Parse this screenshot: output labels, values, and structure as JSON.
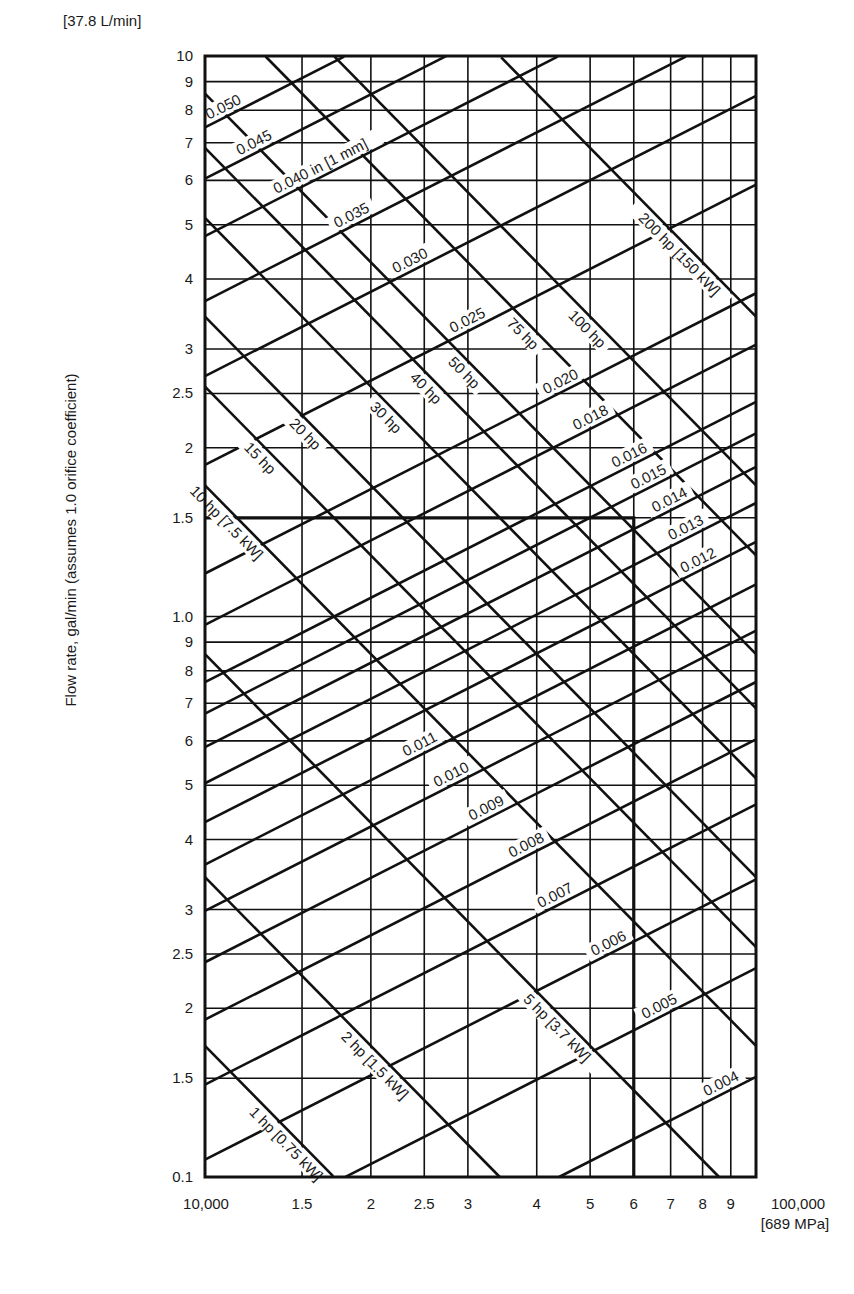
{
  "chart_data": {
    "type": "line",
    "title": "",
    "xlabel": "Pressure, psi",
    "ylabel": "Flow rate, gal/min  (assumes 1.0 orifice coefficient)",
    "x_scale": "log",
    "y_scale": "log",
    "xlim": [
      10000,
      100000
    ],
    "ylim": [
      0.1,
      10
    ],
    "grid": true,
    "x_unit_note": "[689 MPa]",
    "y_unit_note": "[37.8 L/min]",
    "x_ticks": [
      {
        "value": 10000,
        "label": "10,000"
      },
      {
        "value": 15000,
        "label": "1.5"
      },
      {
        "value": 20000,
        "label": "2"
      },
      {
        "value": 25000,
        "label": "2.5"
      },
      {
        "value": 30000,
        "label": "3"
      },
      {
        "value": 40000,
        "label": "4"
      },
      {
        "value": 50000,
        "label": "5"
      },
      {
        "value": 60000,
        "label": "6"
      },
      {
        "value": 70000,
        "label": "7"
      },
      {
        "value": 80000,
        "label": "8"
      },
      {
        "value": 90000,
        "label": "9"
      },
      {
        "value": 100000,
        "label": "100,000"
      }
    ],
    "y_ticks": [
      {
        "value": 10,
        "label": "10"
      },
      {
        "value": 9,
        "label": "9"
      },
      {
        "value": 8,
        "label": "8"
      },
      {
        "value": 7,
        "label": "7"
      },
      {
        "value": 6,
        "label": "6"
      },
      {
        "value": 5,
        "label": "5"
      },
      {
        "value": 4,
        "label": "4"
      },
      {
        "value": 3,
        "label": "3"
      },
      {
        "value": 2.5,
        "label": "2.5"
      },
      {
        "value": 2,
        "label": "2"
      },
      {
        "value": 1.5,
        "label": "1.5"
      },
      {
        "value": 1.0,
        "label": "1.0"
      },
      {
        "value": 0.9,
        "label": "9"
      },
      {
        "value": 0.8,
        "label": "8"
      },
      {
        "value": 0.7,
        "label": "7"
      },
      {
        "value": 0.6,
        "label": "6"
      },
      {
        "value": 0.5,
        "label": "5"
      },
      {
        "value": 0.4,
        "label": "4"
      },
      {
        "value": 0.3,
        "label": "3"
      },
      {
        "value": 0.25,
        "label": "2.5"
      },
      {
        "value": 0.2,
        "label": "2"
      },
      {
        "value": 0.15,
        "label": "1.5"
      },
      {
        "value": 0.1,
        "label": "0.1"
      }
    ],
    "orifice_formula": "Q = 29.83 * d^2 * sqrt(P)",
    "orifice_series": [
      {
        "d": 0.004,
        "label": "0.004",
        "label_x": 88000
      },
      {
        "d": 0.005,
        "label": "0.005",
        "label_x": 68000
      },
      {
        "d": 0.006,
        "label": "0.006",
        "label_x": 55000
      },
      {
        "d": 0.007,
        "label": "0.007",
        "label_x": 44000
      },
      {
        "d": 0.008,
        "label": "0.008",
        "label_x": 39000
      },
      {
        "d": 0.009,
        "label": "0.009",
        "label_x": 33000
      },
      {
        "d": 0.01,
        "label": "0.010",
        "label_x": 28500
      },
      {
        "d": 0.011,
        "label": "0.011",
        "label_x": 25000
      },
      {
        "d": 0.012,
        "label": "0.012",
        "label_x": 80000
      },
      {
        "d": 0.013,
        "label": "0.013",
        "label_x": 76000
      },
      {
        "d": 0.014,
        "label": "0.014",
        "label_x": 71000
      },
      {
        "d": 0.015,
        "label": "0.015",
        "label_x": 65000
      },
      {
        "d": 0.016,
        "label": "0.016",
        "label_x": 60000
      },
      {
        "d": 0.018,
        "label": "0.018",
        "label_x": 51000
      },
      {
        "d": 0.02,
        "label": "0.020",
        "label_x": 45000
      },
      {
        "d": 0.025,
        "label": "0.025",
        "label_x": 30500
      },
      {
        "d": 0.03,
        "label": "0.030",
        "label_x": 24000
      },
      {
        "d": 0.035,
        "label": "0.035",
        "label_x": 18800
      },
      {
        "d": 0.04,
        "label": "0.040 in [1 mm]",
        "label_x": 16500
      },
      {
        "d": 0.045,
        "label": "0.045",
        "label_x": 12500
      },
      {
        "d": 0.05,
        "label": "0.050",
        "label_x": 11000
      }
    ],
    "hp_formula": "hp = Q * P / 1714",
    "hp_series": [
      {
        "hp": 1,
        "label": "1 hp [0.75 kW]",
        "label_x": 14500
      },
      {
        "hp": 2,
        "label": "2 hp [1.5 kW]",
        "label_x": 21000
      },
      {
        "hp": 5,
        "label": "5 hp [3.7 kW]",
        "label_x": 45000
      },
      {
        "hp": 10,
        "label": "10 hp [7.5 kW]",
        "label_x": 11300
      },
      {
        "hp": 15,
        "label": "15 hp",
        "label_x": 13000
      },
      {
        "hp": 20,
        "label": "20 hp",
        "label_x": 15700
      },
      {
        "hp": 30,
        "label": "30 hp",
        "label_x": 22000
      },
      {
        "hp": 40,
        "label": "40 hp",
        "label_x": 26000
      },
      {
        "hp": 50,
        "label": "50 hp",
        "label_x": 30500
      },
      {
        "hp": 75,
        "label": "75 hp",
        "label_x": 39000
      },
      {
        "hp": 100,
        "label": "100 hp",
        "label_x": 51000
      },
      {
        "hp": 200,
        "label": "200 hp [150 kW]",
        "label_x": 75000
      }
    ],
    "example_path": {
      "description": "Bold reference path: horizontal at 1.5 gal/min to 60,000 psi, then vertical down to axis",
      "flow": 1.5,
      "pressure": 60000
    }
  },
  "layout": {
    "plot_left": 205,
    "plot_right": 756,
    "plot_top": 56,
    "plot_bottom": 1177
  }
}
